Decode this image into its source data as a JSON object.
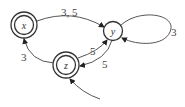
{
  "diagram": {
    "type": "state-machine",
    "nodes": [
      {
        "id": "x",
        "label": "x",
        "accepting": true
      },
      {
        "id": "y",
        "label": "y",
        "accepting": false
      },
      {
        "id": "z",
        "label": "z",
        "accepting": true,
        "initial": true
      }
    ],
    "edges": [
      {
        "from": "x",
        "to": "y",
        "label": "3, 5"
      },
      {
        "from": "y",
        "to": "y",
        "label": "3"
      },
      {
        "from": "z",
        "to": "y",
        "label": "5"
      },
      {
        "from": "y",
        "to": "z",
        "label": "5"
      },
      {
        "from": "z",
        "to": "x",
        "label": "3"
      }
    ],
    "colors": {
      "stroke": "#333333",
      "text": "#444444"
    }
  }
}
